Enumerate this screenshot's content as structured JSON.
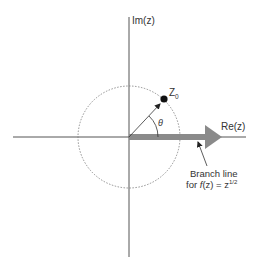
{
  "diagram": {
    "axes": {
      "imag_label": "Im(z)",
      "real_label": "Re(z)"
    },
    "point": {
      "label": "Z",
      "subscript": "0"
    },
    "angle_label": "θ",
    "branch": {
      "line1": "Branch line",
      "line2_prefix": "for ",
      "line2_f": "f",
      "line2_mid": "(z) = z",
      "line2_exp": "1/2"
    },
    "colors": {
      "axis": "#555555",
      "circle": "#777777",
      "branch_line": "#8a8a8a",
      "point": "#111111",
      "text": "#333333"
    }
  }
}
